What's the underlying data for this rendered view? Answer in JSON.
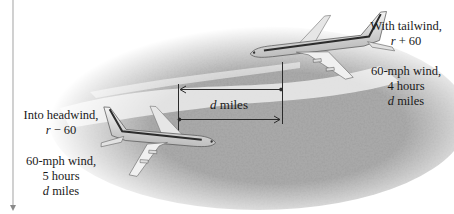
{
  "diagram": {
    "type": "illustration",
    "distance_marker": {
      "label_var": "d",
      "label_unit": "miles"
    },
    "right_plane": {
      "heading_line1": "With tailwind,",
      "rate_var": "r",
      "rate_expr": " + 60",
      "wind": "60-mph wind,",
      "time": "4 hours",
      "dist_var": "d",
      "dist_unit": " miles"
    },
    "left_plane": {
      "heading_line1": "Into headwind,",
      "rate_var": "r",
      "rate_expr": " − 60",
      "wind": "60-mph wind,",
      "time": "5 hours",
      "dist_var": "d",
      "dist_unit": " miles"
    },
    "colors": {
      "terrain_dark": "#6b6b6b",
      "terrain_light": "#c8c8c8",
      "river": "#efefef",
      "stripe": "#2c2c2c",
      "line": "#2a2a2a",
      "rule": "#bdbdbd"
    }
  }
}
